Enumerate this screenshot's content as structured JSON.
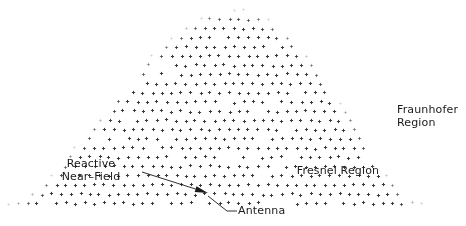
{
  "figure": {
    "width": 466,
    "height": 226,
    "background_color": "#ffffff",
    "ink_color": "#1a1a1a",
    "dot_color": "#3a3a3a"
  },
  "labels": {
    "reactive_near_field": "Reactive\nNear–Field",
    "fresnel_region": "Fresnel Region",
    "fraunhofer_region": "Fraunhofer\nRegion",
    "antenna": "Antenna"
  },
  "chart_data": {
    "type": "scatter",
    "title": "",
    "xlabel": "",
    "ylabel": "",
    "xlim": [
      0,
      466
    ],
    "ylim": [
      0,
      226
    ],
    "grid": false,
    "legend": null,
    "marker": {
      "glyph": "plus",
      "size_px": 3.2,
      "stroke_px": 1,
      "spacing_x": 9.6,
      "spacing_y": 9.2,
      "row_offset_x": 4.8
    },
    "field_boundary": {
      "kind": "dome",
      "baseline_y": 203,
      "apex": {
        "x": 236,
        "y": 8
      },
      "left_foot_x": 8,
      "right_foot_x": 416,
      "left_exponent": 1.55,
      "right_exponent": 1.35
    },
    "fade": {
      "edge_band_px": 16,
      "min_opacity": 0.12,
      "max_opacity": 1.0,
      "jitter_px": 0.9,
      "random_dropout": 0.05
    },
    "annotations": [
      {
        "name": "antenna-arrow",
        "kind": "arrow",
        "from": {
          "x": 142,
          "y": 172
        },
        "to": {
          "x": 208,
          "y": 193
        },
        "head": "filled",
        "head_length": 13,
        "head_width": 6
      },
      {
        "name": "antenna-leader",
        "kind": "polyline",
        "points": [
          {
            "x": 208,
            "y": 196
          },
          {
            "x": 227,
            "y": 211
          },
          {
            "x": 237,
            "y": 211
          }
        ]
      }
    ],
    "label_anchors": [
      {
        "name": "reactive_near_field",
        "x": 91,
        "y": 170
      },
      {
        "name": "fresnel_region",
        "x": 338,
        "y": 171
      },
      {
        "name": "fraunhofer_region",
        "x": 431,
        "y": 116
      },
      {
        "name": "antenna",
        "x": 268,
        "y": 211
      }
    ]
  }
}
